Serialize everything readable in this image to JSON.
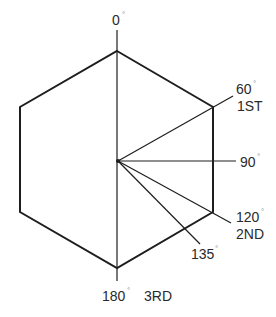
{
  "diagram": {
    "type": "hexagon-angle-diagram",
    "colors": {
      "background": "#ffffff",
      "stroke": "#1e1e1e",
      "text": "#2a2a2a"
    },
    "hexagon": {
      "vertices": [
        [
          117,
          51
        ],
        [
          213,
          107
        ],
        [
          213,
          212
        ],
        [
          117,
          268
        ],
        [
          20,
          212
        ],
        [
          20,
          107
        ]
      ]
    },
    "center": [
      118,
      161
    ],
    "axis": {
      "from": [
        117,
        30
      ],
      "to": [
        117,
        281
      ]
    },
    "rays": [
      {
        "angle": 60,
        "to": [
          233,
          96
        ]
      },
      {
        "angle": 90,
        "to": [
          236,
          161
        ]
      },
      {
        "angle": 120,
        "to": [
          231,
          223
        ]
      },
      {
        "angle": 135,
        "to": [
          200,
          244
        ]
      }
    ],
    "labels": {
      "deg0": {
        "value": "0",
        "unit": "°"
      },
      "deg60": {
        "value": "60",
        "unit": "°",
        "ordinal": "1ST"
      },
      "deg90": {
        "value": "90",
        "unit": "°"
      },
      "deg120": {
        "value": "120",
        "unit": "°",
        "ordinal": "2ND"
      },
      "deg135": {
        "value": "135",
        "unit": "°"
      },
      "deg180": {
        "value": "180",
        "unit": "°",
        "ordinal": "3RD"
      }
    }
  }
}
